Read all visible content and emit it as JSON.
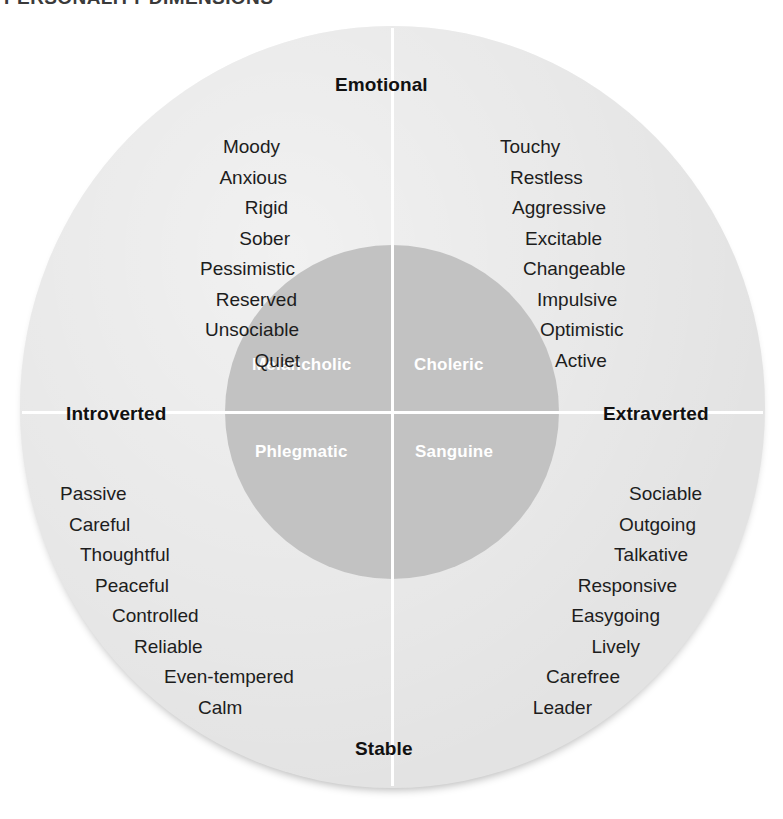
{
  "figure": {
    "title": "PERSONALITY DIMENSIONS",
    "type": "circumplex-quadrant-diagram"
  },
  "colors": {
    "page_background": "#ffffff",
    "outer_circle": "#e3e3e3",
    "inner_circle": "#c2c2c2",
    "axis_line": "#ffffff",
    "trait_text": "#1d1d1d",
    "pole_text": "#111111",
    "temperament_text": "#ffffff"
  },
  "axes": {
    "vertical": {
      "top_pole": "Emotional",
      "bottom_pole": "Stable"
    },
    "horizontal": {
      "left_pole": "Introverted",
      "right_pole": "Extraverted"
    }
  },
  "quadrants": [
    {
      "id": "melancholic",
      "temperament": "Melancholic",
      "position": "top-left",
      "poles": [
        "Introverted",
        "Emotional"
      ],
      "traits": [
        "Moody",
        "Anxious",
        "Rigid",
        "Sober",
        "Pessimistic",
        "Reserved",
        "Unsociable",
        "Quiet"
      ]
    },
    {
      "id": "choleric",
      "temperament": "Choleric",
      "position": "top-right",
      "poles": [
        "Extraverted",
        "Emotional"
      ],
      "traits": [
        "Touchy",
        "Restless",
        "Aggressive",
        "Excitable",
        "Changeable",
        "Impulsive",
        "Optimistic",
        "Active"
      ]
    },
    {
      "id": "phlegmatic",
      "temperament": "Phlegmatic",
      "position": "bottom-left",
      "poles": [
        "Introverted",
        "Stable"
      ],
      "traits": [
        "Passive",
        "Careful",
        "Thoughtful",
        "Peaceful",
        "Controlled",
        "Reliable",
        "Even-tempered",
        "Calm"
      ]
    },
    {
      "id": "sanguine",
      "temperament": "Sanguine",
      "position": "bottom-right",
      "poles": [
        "Extraverted",
        "Stable"
      ],
      "traits": [
        "Sociable",
        "Outgoing",
        "Talkative",
        "Responsive",
        "Easygoing",
        "Lively",
        "Carefree",
        "Leader"
      ]
    }
  ]
}
